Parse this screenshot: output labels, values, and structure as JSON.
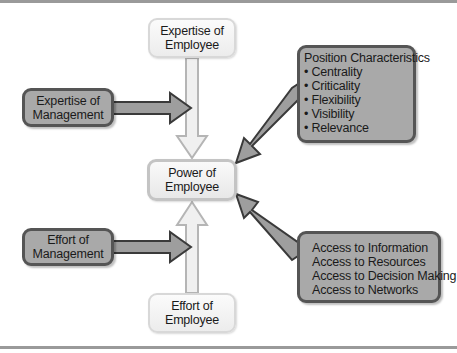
{
  "diagram": {
    "center": {
      "line1": "Power of",
      "line2": "Employee"
    },
    "top": {
      "line1": "Expertise of",
      "line2": "Employee"
    },
    "bottom": {
      "line1": "Effort of",
      "line2": "Employee"
    },
    "left_top": {
      "line1": "Expertise of",
      "line2": "Management"
    },
    "left_bottom": {
      "line1": "Effort of",
      "line2": "Management"
    },
    "position": {
      "title": "Position Characteristics",
      "items": [
        "• Centrality",
        "• Criticality",
        "• Flexibility",
        "• Visibility",
        "• Relevance"
      ]
    },
    "access": {
      "items": [
        "Access to Information",
        "Access to Resources",
        "Access to Decision Making",
        "Access to Networks"
      ]
    },
    "colors": {
      "dark_box": "#a9a9a9",
      "dark_border": "#555555",
      "light_box": "#f2f2f2",
      "rule": "#9a9a9a"
    }
  }
}
